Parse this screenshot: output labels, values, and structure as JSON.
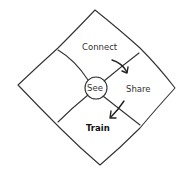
{
  "diagram": {
    "center": {
      "label": "See"
    },
    "regions": [
      {
        "id": "connect",
        "label": "Connect"
      },
      {
        "id": "share",
        "label": "Share"
      },
      {
        "id": "train",
        "label": "Train"
      }
    ],
    "arrows": [
      {
        "from": "connect",
        "to": "share"
      },
      {
        "from": "share",
        "to": "train"
      }
    ],
    "colors": {
      "line": "#333333",
      "background": "#ffffff"
    }
  }
}
